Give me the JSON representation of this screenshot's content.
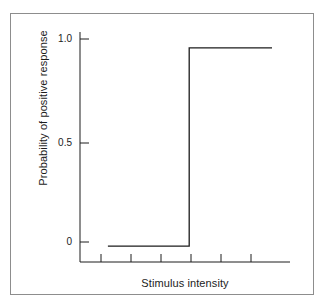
{
  "figure": {
    "background_color": "#ffffff",
    "frame_color": "#8d8d8d",
    "line_color": "#1c1c1c"
  },
  "chart_data": {
    "type": "line",
    "title": "",
    "subtitle": "",
    "xlabel": "Stimulus intensity",
    "ylabel": "Probability of positive response",
    "grid": false,
    "legend": false,
    "legend_position": "none",
    "xlim": [
      0,
      7
    ],
    "ylim": [
      -0.08,
      1.08
    ],
    "yticks": [
      0,
      0.5,
      1.0
    ],
    "ytick_labels": [
      "0",
      "0.5",
      "1.0"
    ],
    "xticks": [
      1,
      2,
      3,
      4,
      5,
      6
    ],
    "xtick_labels": [
      "",
      "",
      "",
      "",
      "",
      ""
    ],
    "annotations": [],
    "threshold_x": 3.64,
    "series": [
      {
        "name": "Ideal psychometric function",
        "type": "step",
        "color": "#1c1c1c",
        "x": [
          0.93,
          3.64,
          3.64,
          6.4
        ],
        "y": [
          0,
          0,
          1.0,
          1.0
        ]
      }
    ]
  },
  "axis_geometry": {
    "y_axis_x": 80,
    "y_axis_top": 32,
    "y_axis_bottom": 262,
    "x_axis_y": 262,
    "x_axis_left": 80,
    "x_axis_right": 290,
    "y_tick_pixels": [
      242,
      143,
      39
    ],
    "x_tick_pixels": [
      101,
      131,
      161,
      191,
      221,
      251
    ],
    "step_left_px": 108,
    "step_riser_px": 189,
    "step_right_px": 272,
    "step_low_y_px": 242,
    "step_high_y_px": 39
  }
}
